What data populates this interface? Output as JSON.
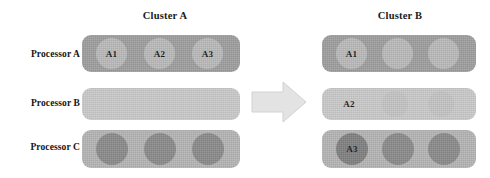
{
  "diagram": {
    "title_left": "Cluster A",
    "title_right": "Cluster B",
    "arrow_icon": "right-block-arrow-icon",
    "colors": {
      "bar_mid": "#9e9e9e",
      "bar_light": "#c9c9c9",
      "bar_soft": "#b4b4b4",
      "circle_pale": "#b9b9b9",
      "circle_faint": "#c3c3c3",
      "circle_dark": "#8a8a8a",
      "circle_darker": "#808080",
      "arrow": "#e2e2e2",
      "text": "#161616",
      "background": "#ffffff"
    }
  },
  "processors": [
    {
      "label": "Processor A"
    },
    {
      "label": "Processor B"
    },
    {
      "label": "Processor C"
    }
  ],
  "cluster_a": {
    "name": "Cluster A",
    "rows": [
      {
        "processor": "Processor A",
        "bar_tone": "tone-mid",
        "slots": [
          {
            "label": "A1",
            "tone": "c-pale"
          },
          {
            "label": "A2",
            "tone": "c-pale"
          },
          {
            "label": "A3",
            "tone": "c-pale"
          }
        ]
      },
      {
        "processor": "Processor B",
        "bar_tone": "tone-light",
        "slots": [
          {
            "label": "",
            "tone": "c-none"
          },
          {
            "label": "",
            "tone": "c-none"
          },
          {
            "label": "",
            "tone": "c-none"
          }
        ]
      },
      {
        "processor": "Processor C",
        "bar_tone": "tone-soft",
        "slots": [
          {
            "label": "",
            "tone": "c-dark"
          },
          {
            "label": "",
            "tone": "c-dark"
          },
          {
            "label": "",
            "tone": "c-dark"
          }
        ]
      }
    ]
  },
  "cluster_b": {
    "name": "Cluster B",
    "rows": [
      {
        "processor": "Processor A",
        "bar_tone": "tone-mid",
        "slots": [
          {
            "label": "A1",
            "tone": "c-pale"
          },
          {
            "label": "",
            "tone": "c-pale"
          },
          {
            "label": "",
            "tone": "c-pale"
          }
        ]
      },
      {
        "processor": "Processor B",
        "bar_tone": "tone-light",
        "slots": [
          {
            "label": "A2",
            "tone": "c-none"
          },
          {
            "label": "",
            "tone": "c-faint"
          },
          {
            "label": "",
            "tone": "c-faint"
          }
        ]
      },
      {
        "processor": "Processor C",
        "bar_tone": "tone-soft",
        "slots": [
          {
            "label": "A3",
            "tone": "c-darker"
          },
          {
            "label": "",
            "tone": "c-dark"
          },
          {
            "label": "",
            "tone": "c-dark"
          }
        ]
      }
    ]
  }
}
